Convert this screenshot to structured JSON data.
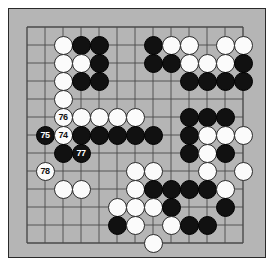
{
  "diagram": {
    "kind": "go-board-diagram",
    "board_size": 13,
    "colors": {
      "board_background": "#b5b5b5",
      "page_background": "#ffffff",
      "grid_line": "#4a4a4a",
      "border": "#2a2a2a",
      "black_stone": "#111111",
      "white_stone": "#fbfbfb",
      "black_label_text": "#ffffff",
      "white_label_text": "#111111"
    },
    "geometry": {
      "origin_x": 18,
      "origin_y": 18,
      "spacing": 18,
      "stone_diameter": 19,
      "columns": 13,
      "rows": 13
    },
    "move_labels": [
      "74",
      "75",
      "76",
      "77",
      "78"
    ],
    "stones": [
      {
        "col": 2,
        "row": 1,
        "color": "white",
        "label": ""
      },
      {
        "col": 3,
        "row": 1,
        "color": "black",
        "label": ""
      },
      {
        "col": 4,
        "row": 1,
        "color": "black",
        "label": ""
      },
      {
        "col": 7,
        "row": 1,
        "color": "black",
        "label": ""
      },
      {
        "col": 8,
        "row": 1,
        "color": "white",
        "label": ""
      },
      {
        "col": 9,
        "row": 1,
        "color": "white",
        "label": ""
      },
      {
        "col": 11,
        "row": 1,
        "color": "white",
        "label": ""
      },
      {
        "col": 12,
        "row": 1,
        "color": "white",
        "label": ""
      },
      {
        "col": 2,
        "row": 2,
        "color": "white",
        "label": ""
      },
      {
        "col": 3,
        "row": 2,
        "color": "white",
        "label": ""
      },
      {
        "col": 4,
        "row": 2,
        "color": "black",
        "label": ""
      },
      {
        "col": 7,
        "row": 2,
        "color": "black",
        "label": ""
      },
      {
        "col": 8,
        "row": 2,
        "color": "black",
        "label": ""
      },
      {
        "col": 9,
        "row": 2,
        "color": "white",
        "label": ""
      },
      {
        "col": 10,
        "row": 2,
        "color": "white",
        "label": ""
      },
      {
        "col": 11,
        "row": 2,
        "color": "white",
        "label": ""
      },
      {
        "col": 12,
        "row": 2,
        "color": "black",
        "label": ""
      },
      {
        "col": 2,
        "row": 3,
        "color": "white",
        "label": ""
      },
      {
        "col": 3,
        "row": 3,
        "color": "black",
        "label": ""
      },
      {
        "col": 4,
        "row": 3,
        "color": "black",
        "label": ""
      },
      {
        "col": 9,
        "row": 3,
        "color": "black",
        "label": ""
      },
      {
        "col": 10,
        "row": 3,
        "color": "black",
        "label": ""
      },
      {
        "col": 11,
        "row": 3,
        "color": "black",
        "label": ""
      },
      {
        "col": 12,
        "row": 3,
        "color": "black",
        "label": ""
      },
      {
        "col": 2,
        "row": 4,
        "color": "white",
        "label": ""
      },
      {
        "col": 2,
        "row": 5,
        "color": "white",
        "label": "76"
      },
      {
        "col": 3,
        "row": 5,
        "color": "white",
        "label": ""
      },
      {
        "col": 4,
        "row": 5,
        "color": "white",
        "label": ""
      },
      {
        "col": 5,
        "row": 5,
        "color": "white",
        "label": ""
      },
      {
        "col": 6,
        "row": 5,
        "color": "white",
        "label": ""
      },
      {
        "col": 9,
        "row": 5,
        "color": "black",
        "label": ""
      },
      {
        "col": 10,
        "row": 5,
        "color": "black",
        "label": ""
      },
      {
        "col": 11,
        "row": 5,
        "color": "black",
        "label": ""
      },
      {
        "col": 1,
        "row": 6,
        "color": "black",
        "label": "75"
      },
      {
        "col": 2,
        "row": 6,
        "color": "white",
        "label": "74"
      },
      {
        "col": 3,
        "row": 6,
        "color": "black",
        "label": ""
      },
      {
        "col": 4,
        "row": 6,
        "color": "black",
        "label": ""
      },
      {
        "col": 5,
        "row": 6,
        "color": "black",
        "label": ""
      },
      {
        "col": 6,
        "row": 6,
        "color": "black",
        "label": ""
      },
      {
        "col": 7,
        "row": 6,
        "color": "black",
        "label": ""
      },
      {
        "col": 9,
        "row": 6,
        "color": "black",
        "label": ""
      },
      {
        "col": 10,
        "row": 6,
        "color": "white",
        "label": ""
      },
      {
        "col": 11,
        "row": 6,
        "color": "white",
        "label": ""
      },
      {
        "col": 12,
        "row": 6,
        "color": "white",
        "label": ""
      },
      {
        "col": 2,
        "row": 7,
        "color": "black",
        "label": ""
      },
      {
        "col": 3,
        "row": 7,
        "color": "black",
        "label": "77"
      },
      {
        "col": 9,
        "row": 7,
        "color": "black",
        "label": ""
      },
      {
        "col": 10,
        "row": 7,
        "color": "white",
        "label": ""
      },
      {
        "col": 11,
        "row": 7,
        "color": "black",
        "label": ""
      },
      {
        "col": 1,
        "row": 8,
        "color": "white",
        "label": "78"
      },
      {
        "col": 6,
        "row": 8,
        "color": "white",
        "label": ""
      },
      {
        "col": 7,
        "row": 8,
        "color": "white",
        "label": ""
      },
      {
        "col": 10,
        "row": 8,
        "color": "white",
        "label": ""
      },
      {
        "col": 12,
        "row": 8,
        "color": "white",
        "label": ""
      },
      {
        "col": 2,
        "row": 9,
        "color": "white",
        "label": ""
      },
      {
        "col": 3,
        "row": 9,
        "color": "white",
        "label": ""
      },
      {
        "col": 6,
        "row": 9,
        "color": "white",
        "label": ""
      },
      {
        "col": 7,
        "row": 9,
        "color": "black",
        "label": ""
      },
      {
        "col": 8,
        "row": 9,
        "color": "black",
        "label": ""
      },
      {
        "col": 9,
        "row": 9,
        "color": "black",
        "label": ""
      },
      {
        "col": 10,
        "row": 9,
        "color": "black",
        "label": ""
      },
      {
        "col": 11,
        "row": 9,
        "color": "white",
        "label": ""
      },
      {
        "col": 5,
        "row": 10,
        "color": "white",
        "label": ""
      },
      {
        "col": 6,
        "row": 10,
        "color": "white",
        "label": ""
      },
      {
        "col": 7,
        "row": 10,
        "color": "white",
        "label": ""
      },
      {
        "col": 8,
        "row": 10,
        "color": "black",
        "label": ""
      },
      {
        "col": 11,
        "row": 10,
        "color": "black",
        "label": ""
      },
      {
        "col": 5,
        "row": 11,
        "color": "black",
        "label": ""
      },
      {
        "col": 6,
        "row": 11,
        "color": "white",
        "label": ""
      },
      {
        "col": 8,
        "row": 11,
        "color": "white",
        "label": ""
      },
      {
        "col": 9,
        "row": 11,
        "color": "black",
        "label": ""
      },
      {
        "col": 10,
        "row": 11,
        "color": "black",
        "label": ""
      },
      {
        "col": 7,
        "row": 12,
        "color": "white",
        "label": ""
      }
    ]
  }
}
